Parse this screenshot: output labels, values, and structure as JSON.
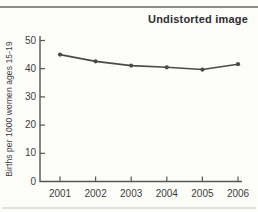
{
  "page": {
    "background": "#fcfcf9",
    "top_rule_color": "#8a8a8a",
    "bottom_rule_color": "#e0e0dc"
  },
  "chart_data": {
    "type": "line",
    "title": "Undistorted image",
    "ylabel": "Births per 1000 women ages 15-19",
    "xlabel": "",
    "categories": [
      "2001",
      "2002",
      "2003",
      "2004",
      "2005",
      "2006"
    ],
    "series": [
      {
        "name": "Births per 1000 women ages 15-19",
        "values": [
          45.0,
          42.6,
          41.1,
          40.5,
          39.7,
          41.6
        ]
      }
    ],
    "yticks": [
      0,
      10,
      20,
      30,
      40,
      50
    ],
    "ylim": [
      0,
      50
    ],
    "grid": false,
    "legend": "none",
    "line_color": "#4a4a4a",
    "axis_color": "#555555",
    "marker": "circle"
  }
}
